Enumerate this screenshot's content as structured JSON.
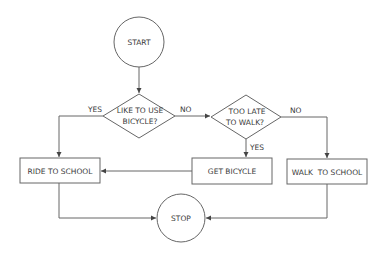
{
  "diagram": {
    "type": "flowchart",
    "colors": {
      "stroke": "#666666",
      "text": "#3a3a3a",
      "background": "#ffffff"
    },
    "nodes": {
      "start": {
        "shape": "circle",
        "label": "START"
      },
      "decision_bicycle": {
        "shape": "diamond",
        "line1": "LIKE TO USE",
        "line2": "BICYCLE?"
      },
      "decision_late": {
        "shape": "diamond",
        "line1": "TOO LATE",
        "line2": "TO WALK?"
      },
      "ride": {
        "shape": "rect",
        "label": "RIDE TO SCHOOL"
      },
      "get_bicycle": {
        "shape": "rect",
        "label": "GET BICYCLE"
      },
      "walk": {
        "shape": "rect",
        "label": "WALK  TO SCHOOL"
      },
      "stop": {
        "shape": "circle",
        "label": "STOP"
      }
    },
    "edge_labels": {
      "bicycle_yes": "YES",
      "bicycle_no": "NO",
      "late_yes": "YES",
      "late_no": "NO"
    },
    "edges": [
      {
        "from": "START",
        "to": "LIKE TO USE BICYCLE?"
      },
      {
        "from": "LIKE TO USE BICYCLE?",
        "to": "RIDE TO SCHOOL",
        "label": "YES"
      },
      {
        "from": "LIKE TO USE BICYCLE?",
        "to": "TOO LATE TO WALK?",
        "label": "NO"
      },
      {
        "from": "TOO LATE TO WALK?",
        "to": "GET BICYCLE",
        "label": "YES"
      },
      {
        "from": "TOO LATE TO WALK?",
        "to": "WALK TO SCHOOL",
        "label": "NO"
      },
      {
        "from": "GET BICYCLE",
        "to": "RIDE TO SCHOOL"
      },
      {
        "from": "RIDE TO SCHOOL",
        "to": "STOP"
      },
      {
        "from": "WALK TO SCHOOL",
        "to": "STOP"
      }
    ]
  }
}
